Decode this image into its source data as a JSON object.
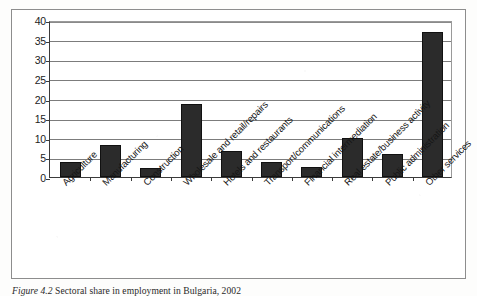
{
  "figure": {
    "caption_label": "Figure 4.2",
    "caption_text": "Sectoral share in employment in Bulgaria, 2002",
    "caption_full": "Figure 4.2  Sectoral share in employment in Bulgaria, 2002"
  },
  "chart_data": {
    "type": "bar",
    "title": "",
    "xlabel": "",
    "ylabel": "",
    "ylim": [
      0,
      40
    ],
    "yticks": [
      0,
      5,
      10,
      15,
      20,
      25,
      30,
      35,
      40
    ],
    "ytick_labels": [
      "0",
      "5",
      "10",
      "15",
      "20",
      "25",
      "30",
      "35",
      "40"
    ],
    "grid": true,
    "legend": false,
    "bar_color": "#2b2b2b",
    "categories": [
      "Agriculture",
      "Manufacturing",
      "Construction",
      "Wholesale and retail/repairs",
      "Hotels and restaurants",
      "Transport/communications",
      "Financial intermediation",
      "Real estate/business activity",
      "Public administration",
      "Other services"
    ],
    "values": [
      3.7,
      8.2,
      2.4,
      18.7,
      6.6,
      3.8,
      2.6,
      9.9,
      5.8,
      37.0
    ]
  }
}
